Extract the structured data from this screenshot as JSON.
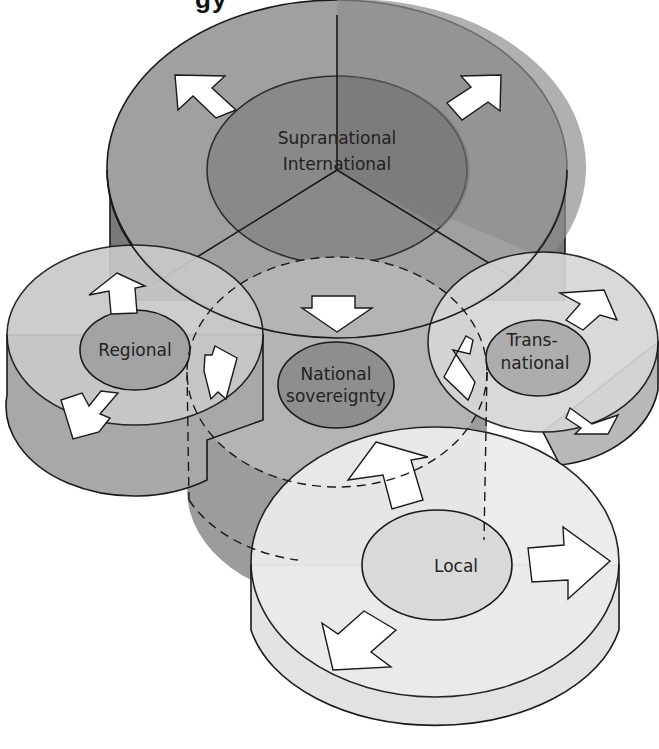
{
  "figure": {
    "title_fragment": "gy",
    "type": "layered cylinder diagram of levels of governance",
    "levels": [
      {
        "id": "supranational",
        "label_line1": "Supranational",
        "label_line2": "International",
        "position": "top",
        "arrows": [
          "outward-up-left",
          "outward-up-right",
          "inward-down"
        ]
      },
      {
        "id": "regional",
        "label": "Regional",
        "position": "left",
        "arrows": [
          "outward-up",
          "outward-down-left",
          "inward-right"
        ]
      },
      {
        "id": "transnational",
        "label_line1": "Trans-",
        "label_line2": "national",
        "position": "right",
        "arrows": [
          "outward-up-right",
          "outward-down-right",
          "inward-left"
        ]
      },
      {
        "id": "national",
        "label_line1": "National",
        "label_line2": "sovereignty",
        "position": "center",
        "boundary": "dashed"
      },
      {
        "id": "local",
        "label": "Local",
        "position": "bottom",
        "arrows": [
          "inward-up",
          "outward-right",
          "outward-down-left"
        ]
      }
    ],
    "colors": {
      "supranational_top": "#9c9c9c",
      "supranational_inner": "#858585",
      "supranational_side": "#7a7a7a",
      "regional_top": "#c9c9c9",
      "regional_inner": "#a3a3a3",
      "regional_side": "#a8a8a8",
      "transnational_top": "#d6d6d6",
      "transnational_inner": "#adadad",
      "transnational_side": "#b8b8b8",
      "national_fill": "#b4b4b4",
      "national_inner": "#8e8e8e",
      "national_side": "#9a9a9a",
      "local_top": "#ebebeb",
      "local_inner": "#d9d9d9",
      "local_side": "#e2e2e2",
      "arrow": "#ffffff",
      "outline": "#1a1a1a"
    }
  }
}
